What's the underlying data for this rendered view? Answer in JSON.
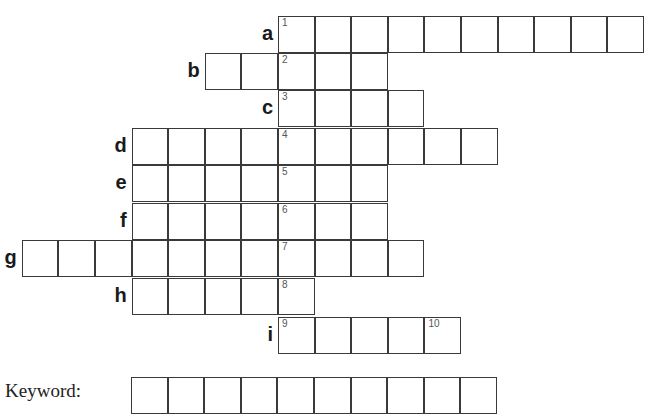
{
  "puzzle": {
    "cell_size": 36.6,
    "key_column_x": 278,
    "rows": [
      {
        "label": "a",
        "top": 16,
        "start_offset": 0,
        "length": 10,
        "number": "1"
      },
      {
        "label": "b",
        "top": 53,
        "start_offset": -2,
        "length": 5,
        "number": "2"
      },
      {
        "label": "c",
        "top": 90,
        "start_offset": 0,
        "length": 4,
        "number": "3"
      },
      {
        "label": "d",
        "top": 128,
        "start_offset": -4,
        "length": 10,
        "number": "4"
      },
      {
        "label": "e",
        "top": 165,
        "start_offset": -4,
        "length": 7,
        "number": "5"
      },
      {
        "label": "f",
        "top": 203,
        "start_offset": -4,
        "length": 7,
        "number": "6"
      },
      {
        "label": "g",
        "top": 240,
        "start_offset": -7,
        "length": 11,
        "number": "7"
      },
      {
        "label": "h",
        "top": 278,
        "start_offset": -4,
        "length": 5,
        "number": "8"
      },
      {
        "label": "i",
        "top": 317,
        "start_offset": 0,
        "length": 5,
        "number": "9",
        "extra_numbers": {
          "4": "10"
        }
      }
    ],
    "keyword": {
      "label": "Keyword:",
      "top": 377,
      "left": 131,
      "length": 10
    }
  }
}
